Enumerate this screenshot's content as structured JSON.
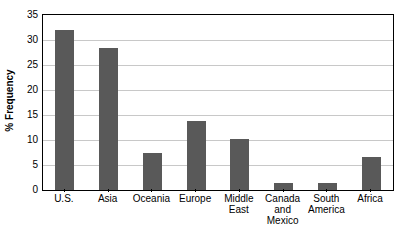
{
  "chart_data": {
    "type": "bar",
    "title": "",
    "xlabel": "",
    "ylabel": "% Frequency",
    "ylim": [
      0,
      35
    ],
    "ytick_step": 5,
    "yticks": [
      "0",
      "5",
      "10",
      "15",
      "20",
      "25",
      "30",
      "35"
    ],
    "grid": "horizontal",
    "legend": "none",
    "bar_color": "#595959",
    "gridline_color": "#c8c8c8",
    "axis_color": "#000000",
    "background_color": "#ffffff",
    "categories": [
      "U.S.",
      "Asia",
      "Oceania",
      "Europe",
      "Middle East",
      "Canada and Mexico",
      "South America",
      "Africa"
    ],
    "category_label_lines": [
      [
        "U.S."
      ],
      [
        "Asia"
      ],
      [
        "Oceania"
      ],
      [
        "Europe"
      ],
      [
        "Middle",
        "East"
      ],
      [
        "Canada",
        "and",
        "Mexico"
      ],
      [
        "South",
        "America"
      ],
      [
        "Africa"
      ]
    ],
    "values": [
      32.0,
      28.4,
      7.5,
      13.8,
      10.2,
      1.4,
      1.4,
      6.6
    ]
  }
}
